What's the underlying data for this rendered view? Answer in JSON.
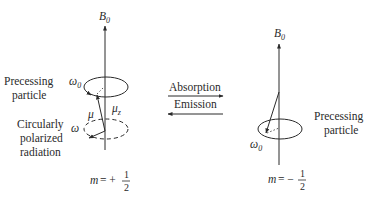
{
  "left_panel": {
    "field_label": "B",
    "field_sub": "0",
    "precessing_label_line1": "Precessing",
    "precessing_label_line2": "particle",
    "omega0_symbol": "ω",
    "omega0_sub": "0",
    "mu_symbol": "μ",
    "muz_symbol": "μ",
    "muz_sub": "z",
    "radiation_label_line1": "Circularly",
    "radiation_label_line2": "polarized",
    "radiation_label_line3": "radiation",
    "omega_symbol": "ω",
    "state_m": "m",
    "state_eq": "= +",
    "state_num": "1",
    "state_den": "2"
  },
  "transitions": {
    "absorption_label": "Absorption",
    "emission_label": "Emission"
  },
  "right_panel": {
    "field_label": "B",
    "field_sub": "0",
    "precessing_label_line1": "Precessing",
    "precessing_label_line2": "particle",
    "omega0_symbol": "ω",
    "omega0_sub": "0",
    "state_m": "m",
    "state_eq": "= −",
    "state_num": "1",
    "state_den": "2"
  },
  "colors": {
    "ink": "#2a2a2a"
  }
}
